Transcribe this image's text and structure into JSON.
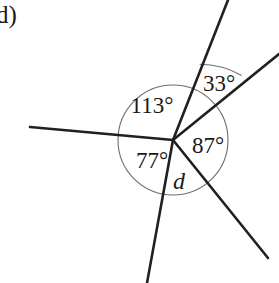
{
  "figure": {
    "part_label": "d)",
    "width": 279,
    "height": 283,
    "background_color": "#ffffff",
    "ray_color": "#231f20",
    "arc_color": "#6d6d6d",
    "text_color": "#1a1a1a",
    "vertex": {
      "x": 173,
      "y": 140
    },
    "circle": {
      "cx": 173,
      "cy": 140,
      "r": 55
    },
    "outer_arc": {
      "cx": 173,
      "cy": 140,
      "r": 86
    },
    "rays": [
      {
        "name": "ray-left-horizontal",
        "x1": 173,
        "y1": 140,
        "x2": 30,
        "y2": 127
      },
      {
        "name": "ray-up-steep",
        "x1": 173,
        "y1": 140,
        "x2": 228,
        "y2": 0
      },
      {
        "name": "ray-upper-right",
        "x1": 173,
        "y1": 140,
        "x2": 279,
        "y2": 54
      },
      {
        "name": "ray-lower-right",
        "x1": 173,
        "y1": 140,
        "x2": 268,
        "y2": 258
      },
      {
        "name": "ray-down-left",
        "x1": 173,
        "y1": 140,
        "x2": 147,
        "y2": 283
      }
    ],
    "angles": [
      {
        "name": "angle-113",
        "label": "113°",
        "x": 152,
        "y": 105
      },
      {
        "name": "angle-33",
        "label": "33°",
        "x": 219,
        "y": 83
      },
      {
        "name": "angle-87",
        "label": "87°",
        "x": 208,
        "y": 145
      },
      {
        "name": "angle-77",
        "label": "77°",
        "x": 152,
        "y": 160
      },
      {
        "name": "angle-d",
        "label": "d",
        "x": 179,
        "y": 181
      }
    ]
  }
}
